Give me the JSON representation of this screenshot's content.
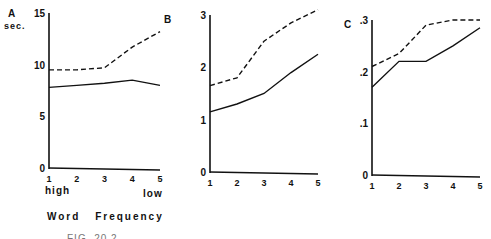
{
  "chart_data": [
    {
      "type": "line",
      "panel": "A",
      "ylabel": "sec.",
      "xlabel": "Word Frequency",
      "x": [
        1,
        2,
        3,
        4,
        5
      ],
      "x_tick_labels": [
        "1",
        "2",
        "3",
        "4",
        "5"
      ],
      "x_end_labels": {
        "left": "high",
        "right": "low"
      },
      "y_ticks": [
        "0",
        "5",
        "10",
        "15"
      ],
      "ylim": [
        0,
        15
      ],
      "series": [
        {
          "name": "dashed",
          "style": "dashed",
          "values": [
            9.5,
            9.5,
            9.7,
            11.7,
            13.2
          ]
        },
        {
          "name": "solid",
          "style": "solid",
          "values": [
            7.8,
            8.0,
            8.2,
            8.5,
            8.0
          ]
        }
      ]
    },
    {
      "type": "line",
      "panel": "B",
      "x": [
        1,
        2,
        3,
        4,
        5
      ],
      "x_tick_labels": [
        "1",
        "2",
        "3",
        "4",
        "5"
      ],
      "y_ticks": [
        "0",
        "1",
        "2",
        "3"
      ],
      "ylim": [
        0,
        3
      ],
      "series": [
        {
          "name": "dashed",
          "style": "dashed",
          "values": [
            1.65,
            1.8,
            2.5,
            2.85,
            3.1
          ]
        },
        {
          "name": "solid",
          "style": "solid",
          "values": [
            1.15,
            1.3,
            1.5,
            1.9,
            2.25
          ]
        }
      ]
    },
    {
      "type": "line",
      "panel": "C",
      "x": [
        1,
        2,
        3,
        4,
        5
      ],
      "x_tick_labels": [
        "1",
        "2",
        "3",
        "4",
        "5"
      ],
      "y_ticks": [
        "0",
        ".1",
        ".2",
        ".3"
      ],
      "ylim": [
        0,
        0.3
      ],
      "series": [
        {
          "name": "dashed",
          "style": "dashed",
          "values": [
            0.21,
            0.235,
            0.29,
            0.3,
            0.3
          ]
        },
        {
          "name": "solid",
          "style": "solid",
          "values": [
            0.17,
            0.22,
            0.22,
            0.25,
            0.285
          ]
        }
      ]
    }
  ],
  "labels": {
    "panel_a": "A",
    "panel_b": "B",
    "panel_c": "C",
    "unit": "sec.",
    "high": "high",
    "low": "low",
    "xlabel": "Word Frequency",
    "caption": "FIG. 20.2"
  }
}
